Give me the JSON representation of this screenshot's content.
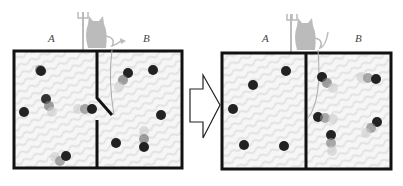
{
  "diagram": {
    "left_panel": {
      "labels": {
        "a": "A",
        "b": "B"
      },
      "state": "before",
      "gate": "open"
    },
    "right_panel": {
      "labels": {
        "a": "A",
        "b": "B"
      },
      "state": "after",
      "gate": "closed"
    },
    "arrow": "right-arrow",
    "colors": {
      "border": "#111111",
      "demon": "#bbbbbb",
      "particle": "#333333",
      "background": "#f4f4f4"
    }
  }
}
